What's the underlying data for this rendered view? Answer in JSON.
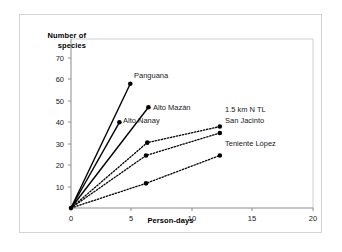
{
  "chart_data": {
    "type": "line",
    "title": "",
    "xlabel": "Person-days",
    "ylabel": "Number of\nspecies",
    "xlim": [
      0,
      20
    ],
    "ylim": [
      0,
      75
    ],
    "xticks": [
      "0",
      "5",
      "10",
      "15",
      "20"
    ],
    "yticks": [
      "10",
      "20",
      "30",
      "40",
      "50",
      "60",
      "70"
    ],
    "grid": false,
    "legend_position": "inline-end-of-line",
    "marker": "filled-circle",
    "series": [
      {
        "name": "Panguana",
        "style": "solid",
        "x": [
          0,
          4.9
        ],
        "y": [
          0,
          58
        ]
      },
      {
        "name": "Alto Mazán",
        "style": "solid",
        "x": [
          0,
          6.4
        ],
        "y": [
          0,
          47
        ]
      },
      {
        "name": "Alto Nanay",
        "style": "solid",
        "x": [
          0,
          4.0
        ],
        "y": [
          0,
          40
        ]
      },
      {
        "name": "1.5 km N TL",
        "style": "dotted",
        "x": [
          0,
          6.3,
          12.3
        ],
        "y": [
          0,
          30.5,
          38
        ]
      },
      {
        "name": "San Jacinto",
        "style": "dotted",
        "x": [
          0,
          6.2,
          12.3
        ],
        "y": [
          0,
          24.5,
          35
        ]
      },
      {
        "name": "Teniente López",
        "style": "dotted",
        "x": [
          0,
          6.2,
          12.3
        ],
        "y": [
          0,
          11.5,
          24.5
        ]
      }
    ]
  },
  "labels": {
    "panguana": "Panguana",
    "alto_mazan": "Alto Mazán",
    "alto_nanay": "Alto Nanay",
    "km_n_tl": "1.5 km N TL",
    "san_jacinto": "San Jacinto",
    "teniente_lopez": "Teniente López"
  },
  "axis": {
    "y_title_line1": "Number of",
    "y_title_line2": "species",
    "x_title": "Person-days",
    "y_10": "10",
    "y_20": "20",
    "y_30": "30",
    "y_40": "40",
    "y_50": "50",
    "y_60": "60",
    "y_70": "70",
    "x_0": "0",
    "x_5": "5",
    "x_10": "10",
    "x_15": "15",
    "x_20": "20"
  },
  "colors": {
    "line": "#000000",
    "marker": "#000000",
    "axis": "#9a9a9a",
    "card_border": "#d4d4d4",
    "background": "#ffffff",
    "text": "#1a1a1a"
  }
}
